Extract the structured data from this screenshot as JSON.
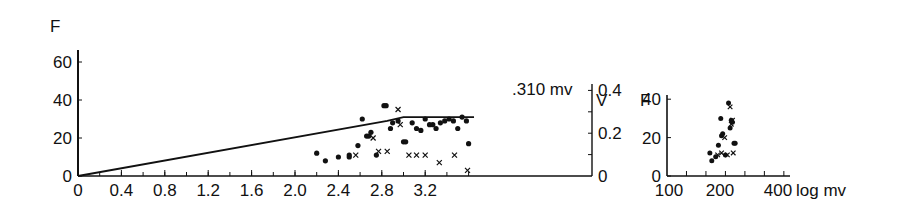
{
  "chart_data": [
    {
      "type": "scatter",
      "title": "",
      "ylabel": "F",
      "ylabel_right": "V",
      "xlabel": "",
      "xlim": [
        0,
        3.65
      ],
      "ylim": [
        0,
        65
      ],
      "ylim_right": [
        0,
        0.43
      ],
      "x_ticks": [
        "0",
        "0.4",
        "0.8",
        "1.2",
        "1.6",
        "2.0",
        "2.4",
        "2.8",
        "3.2"
      ],
      "y_ticks": [
        "0",
        "20",
        "40",
        "60"
      ],
      "y_right_ticks": [
        "0",
        "0.2",
        "0.4"
      ],
      "annotation": ".310 mv",
      "line": {
        "name": "V (voltage) curve",
        "x": [
          0,
          2.85,
          3.0,
          3.65
        ],
        "y": [
          0,
          29,
          31,
          31
        ]
      },
      "series": [
        {
          "name": "dots",
          "marker": "circle",
          "x": [
            2.2,
            2.28,
            2.4,
            2.5,
            2.5,
            2.58,
            2.62,
            2.66,
            2.68,
            2.7,
            2.75,
            2.82,
            2.84,
            2.88,
            2.9,
            2.95,
            3.0,
            3.02,
            3.08,
            3.12,
            3.16,
            3.2,
            3.24,
            3.27,
            3.3,
            3.34,
            3.38,
            3.42,
            3.46,
            3.5,
            3.54,
            3.58,
            3.6
          ],
          "y": [
            12,
            8,
            10,
            11,
            10,
            16,
            30,
            21,
            21,
            23,
            11,
            37,
            37,
            25,
            28,
            29,
            18,
            18,
            28,
            25,
            24,
            30,
            27,
            27,
            25,
            28,
            29,
            30,
            29,
            25,
            31,
            29,
            17
          ]
        },
        {
          "name": "crosses",
          "marker": "x",
          "x": [
            2.56,
            2.72,
            2.77,
            2.85,
            2.95,
            2.97,
            3.05,
            3.12,
            3.2,
            3.33,
            3.47,
            3.59
          ],
          "y": [
            11,
            20,
            13,
            13,
            35,
            27,
            11,
            11,
            11,
            7,
            11,
            3
          ]
        }
      ]
    },
    {
      "type": "scatter",
      "title": "",
      "ylabel": "F",
      "xlabel": "log mv",
      "xlim": [
        100,
        400
      ],
      "ylim": [
        0,
        55
      ],
      "x_ticks": [
        "100",
        "200",
        "400"
      ],
      "y_ticks": [
        "0",
        "20",
        "40"
      ],
      "series": [
        {
          "name": "dots",
          "marker": "circle",
          "x": [
            210,
            215,
            225,
            232,
            238,
            240,
            243,
            250,
            258,
            262,
            265,
            268,
            272,
            275
          ],
          "y": [
            12,
            8,
            10,
            16,
            30,
            21,
            22,
            11,
            38,
            25,
            29,
            28,
            17,
            17
          ]
        },
        {
          "name": "crosses",
          "marker": "x",
          "x": [
            230,
            240,
            248,
            255,
            262,
            265,
            268,
            270
          ],
          "y": [
            11,
            12,
            20,
            11,
            36,
            27,
            29,
            12
          ]
        }
      ]
    }
  ],
  "labels": {
    "main_ylabel": "F",
    "right_ylabel": "V",
    "annotation": ".310 mv",
    "inset_ylabel": "F",
    "inset_xlabel": "log mv"
  }
}
